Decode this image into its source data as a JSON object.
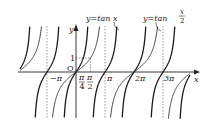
{
  "chart_data": {
    "type": "line",
    "title": "",
    "xlabel": "x",
    "ylabel": "y",
    "origin_label": "O",
    "xlim": [
      -2.6,
      3.8
    ],
    "ylim": [
      -4,
      4.4
    ],
    "x_unit": "pi",
    "x_ticks": [
      "-π",
      "π/4",
      "π/2",
      "π",
      "2π",
      "3π"
    ],
    "y_ticks": [
      "1"
    ],
    "series": [
      {
        "name": "y = tan x",
        "label": "y=tan x",
        "function": "tan(x)",
        "asymptotes_pi": [
          -2.5,
          -1.5,
          -0.5,
          0.5,
          1.5,
          2.5,
          3.5
        ],
        "zeros_pi": [
          -2,
          -1,
          0,
          1,
          2,
          3
        ]
      },
      {
        "name": "y = tan(x/2)",
        "label": "y=tan x/2",
        "function": "tan(x/2)",
        "asymptotes_pi": [
          -1,
          1,
          3
        ],
        "zeros_pi": [
          -2,
          0,
          2
        ]
      }
    ],
    "reference_lines": [
      {
        "type": "dashed-vertical",
        "x": "-π"
      },
      {
        "type": "dashed-vertical",
        "x": "π"
      },
      {
        "type": "dashed-vertical",
        "x": "3π"
      },
      {
        "type": "dashed-point",
        "x": "π/2",
        "y": 1
      }
    ],
    "annotations": {
      "label_tan_x": "y=tan x",
      "label_tan_half_y": "y=tan",
      "label_tan_half_num": "x",
      "label_tan_half_den": "2"
    }
  },
  "labels": {
    "neg_pi": "−π",
    "pi_over": "π",
    "four": "4",
    "two": "2",
    "pi": "π",
    "two_pi": "2π",
    "three_pi": "3π",
    "x": "x",
    "y": "y",
    "one": "1",
    "origin": "O"
  }
}
